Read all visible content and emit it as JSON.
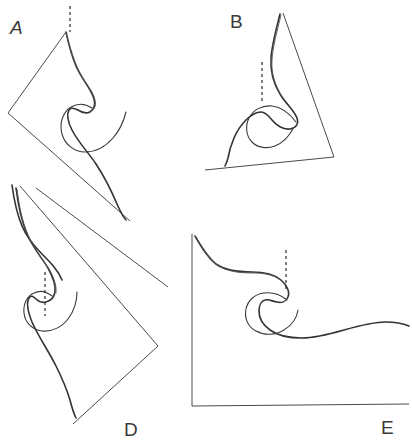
{
  "figure": {
    "domain_note": "scanned line-drawing figure with five labelled panels",
    "background_color": "#ffffff",
    "ink_color": "#3a3a3a",
    "axis_color": "#4a4a4a",
    "curve_color": "#333333",
    "dashed_color": "#2b2b2b",
    "width": 412,
    "height": 446,
    "panels": [
      {
        "id": "A",
        "label": "A",
        "label_style": "italic",
        "label_x": 10,
        "label_y": 18,
        "axis_type": "rotated-chevron",
        "axis_rotation_deg": -45,
        "has_dashed_reference": true,
        "dashed_orientation": "vertical",
        "curve_description": "cusped swallowtail profile with loop"
      },
      {
        "id": "B",
        "label": "B",
        "label_style": "normal",
        "label_x": 230,
        "label_y": 12,
        "axis_type": "tilted-L",
        "axis_rotation_deg": -8,
        "has_dashed_reference": true,
        "dashed_orientation": "vertical",
        "curve_description": "cusped swallowtail profile with loop"
      },
      {
        "id": "C",
        "label": "",
        "label_style": "normal",
        "label_x": 0,
        "label_y": 0,
        "axis_type": "diagonal-partial",
        "axis_rotation_deg": -45,
        "has_dashed_reference": false,
        "dashed_orientation": "none",
        "curve_description": "partial curve fragment upper-left of lower row"
      },
      {
        "id": "D",
        "label": "D",
        "label_style": "normal",
        "label_x": 124,
        "label_y": 420,
        "axis_type": "rotated-chevron",
        "axis_rotation_deg": -45,
        "has_dashed_reference": true,
        "dashed_orientation": "vertical",
        "curve_description": "cusped swallowtail profile with loop"
      },
      {
        "id": "E",
        "label": "E",
        "label_style": "normal",
        "label_x": 381,
        "label_y": 418,
        "axis_type": "upright-L",
        "axis_rotation_deg": 0,
        "has_dashed_reference": true,
        "dashed_orientation": "vertical",
        "curve_description": "cusped swallowtail profile with loop and long tail"
      }
    ]
  },
  "chart_data": {
    "type": "line",
    "title": "",
    "xlabel": "",
    "ylabel": "",
    "grid": false,
    "legend": "none",
    "note": "Five hand-drawn panels (A-E) each showing the same cusped/swallowtail curve family, drawn at different axis orientations. Panel C is unlabelled in the visible crop.",
    "series": [
      {
        "name": "A",
        "path": "M66,32 C69,46 72,56 76,66 C82,80 91,88 94,99 C96,106 93,110 90,112 C86,114 81,112 78,110 C74,108 71,107 69,110 C66,115 68,122 72,130 C78,142 88,152 96,164 C104,176 111,190 117,204 C121,213 124,218 126,220",
        "overlay_path": "M66,33 C70,48 73,58 78,69 C85,84 93,90 95,100 C97,107 93,111 89,112",
        "loop_path": "M92,108 C86,104 78,103 71,107 C63,112 59,123 62,134 C65,145 75,152 85,152 C96,152 106,146 113,138 C120,130 124,120 126,112",
        "axis_path": "M66,32 L8,113 L130,221",
        "dashed_path": "M70,6 L70,32"
      },
      {
        "name": "B",
        "path": "M280,14 C276,30 272,44 271,58 C270,72 274,84 280,94 C286,104 294,110 297,118 C299,124 296,128 290,129 C283,130 276,125 272,120 C268,115 265,112 261,112 C255,112 250,116 246,120 C241,125 237,131 234,138 C231,145 229,152 228,158 C227,162 226,164 225,166",
        "overlay_path": "M281,15 C277,32 273,46 272,60 C271,73 275,85 281,95",
        "loop_path": "M296,122 C290,114 281,107 272,106 C262,105 253,110 249,118 C245,126 246,136 252,142 C258,148 267,149 275,146 C283,143 289,136 293,129",
        "axis_path": "M283,13 L334,157 L205,170",
        "dashed_path": "M262,62 L262,104"
      },
      {
        "name": "C",
        "path": "M12,185 C14,200 17,214 22,226 C27,238 34,246 42,254 C50,262 58,270 62,280",
        "overlay_path": "",
        "loop_path": "",
        "axis_path": "M36,188 L168,287",
        "dashed_path": ""
      },
      {
        "name": "D",
        "path": "M16,188 C18,204 21,220 27,234 C33,248 42,258 48,268 C53,277 56,285 55,292 C54,298 50,301 46,302 C42,303 38,301 36,299 C33,296 31,295 29,298 C26,303 28,312 32,322 C38,336 48,350 56,366 C62,378 67,390 70,400 C72,408 74,414 76,418",
        "overlay_path": "M17,189 C19,205 22,221 28,235 C34,249 42,259 49,269 C54,278 57,286 56,293",
        "loop_path": "M52,296 C47,292 40,290 34,293 C27,296 23,304 24,313 C25,323 33,330 42,331 C52,332 62,327 68,319 C74,311 77,301 77,292",
        "axis_path": "M20,186 L158,346 L73,424",
        "dashed_path": "M45,272 L45,316"
      },
      {
        "name": "E",
        "path": "M195,236 C202,248 208,258 216,264 C226,271 240,272 252,272 C264,272 274,274 281,280 C287,285 290,292 288,297 C286,302 281,303 277,302 C272,301 268,299 265,300 C261,301 259,306 259,311 C259,318 263,325 270,330 C278,336 290,338 302,338 C316,338 330,334 344,330 C358,326 372,322 386,322 C396,322 404,324 409,326",
        "overlay_path": "M196,237 C203,249 209,259 217,265 C227,272 241,273 253,273 C265,273 275,275 282,281",
        "loop_path": "M287,300 C281,295 272,292 264,293 C255,294 248,300 246,309 C244,318 248,327 256,331 C265,336 276,335 284,330 C292,325 297,317 298,310",
        "axis_path": "M192,234 L192,406 L409,404",
        "dashed_path": "M286,250 L286,290"
      }
    ]
  }
}
